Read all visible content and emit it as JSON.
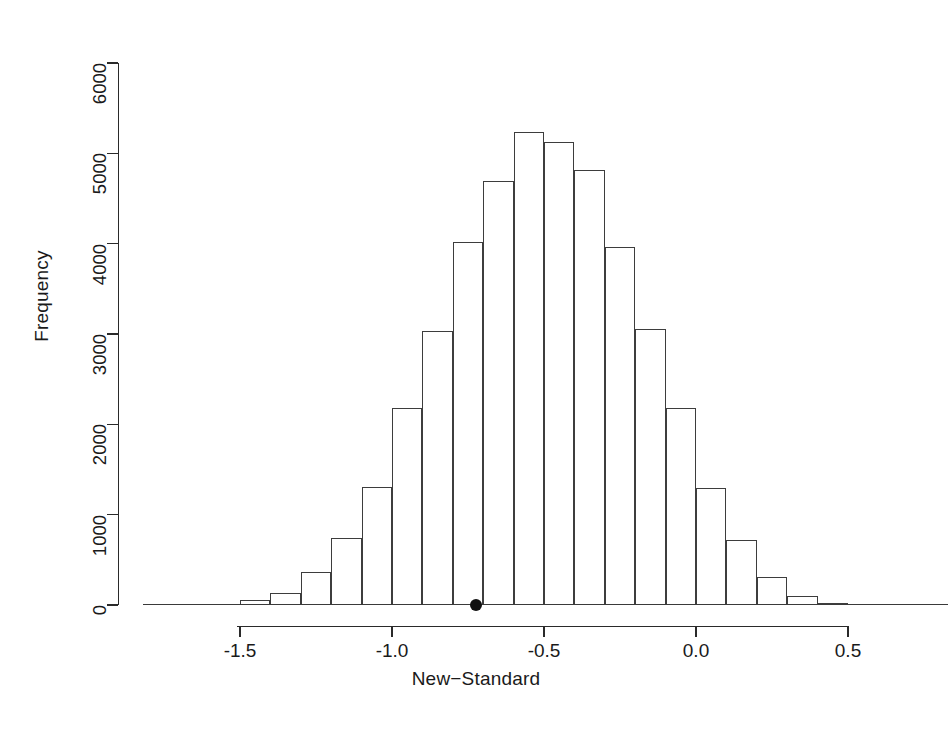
{
  "chart_data": {
    "type": "bar",
    "title": "",
    "xlabel": "New−Standard",
    "ylabel": "Frequency",
    "xlim": [
      -1.65,
      0.62
    ],
    "ylim": [
      0,
      6000
    ],
    "grid": false,
    "legend": null,
    "bin_width": 0.1,
    "bin_edges": [
      -1.6,
      -1.5,
      -1.4,
      -1.3,
      -1.2,
      -1.1,
      -1.0,
      -0.9,
      -0.8,
      -0.7,
      -0.6,
      -0.5,
      -0.4,
      -0.3,
      -0.2,
      -0.1,
      0.0,
      0.1,
      0.2,
      0.3,
      0.4,
      0.5
    ],
    "categories": [
      "-1.60",
      "-1.50",
      "-1.40",
      "-1.30",
      "-1.20",
      "-1.10",
      "-1.00",
      "-0.90",
      "-0.80",
      "-0.70",
      "-0.60",
      "-0.50",
      "-0.40",
      "-0.30",
      "-0.20",
      "-0.10",
      "0.00",
      "0.10",
      "0.20",
      "0.30",
      "0.40"
    ],
    "values": [
      10,
      50,
      130,
      360,
      740,
      1310,
      2180,
      3030,
      4020,
      4690,
      5240,
      5130,
      4810,
      3960,
      3060,
      2180,
      1300,
      720,
      310,
      100,
      20
    ],
    "xticks": [
      -1.5,
      -1.0,
      -0.5,
      0.0,
      0.5
    ],
    "xtick_labels": [
      "-1.5",
      "-1.0",
      "-0.5",
      "0.0",
      "0.5"
    ],
    "yticks": [
      0,
      1000,
      2000,
      3000,
      4000,
      5000,
      6000
    ],
    "ytick_labels": [
      "0",
      "1000",
      "2000",
      "3000",
      "4000",
      "5000",
      "6000"
    ],
    "annotations": [
      {
        "name": "observed-statistic-point",
        "x": -0.723,
        "y": 0,
        "marker": "filled-circle",
        "color": "#111111"
      }
    ],
    "colors": {
      "bar_outline": "#3d3d3d",
      "bar_fill": "transparent",
      "axis": "#2a2a2a",
      "point": "#111111",
      "background": "#ffffff"
    }
  }
}
